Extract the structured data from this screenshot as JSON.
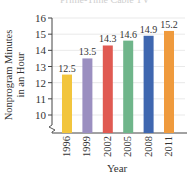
{
  "chart_data": {
    "type": "bar",
    "title": "Prime-Time Cable TV",
    "xlabel": "Year",
    "ylabel": [
      "Nonprogram Minutes",
      "in an Hour"
    ],
    "categories": [
      "1996",
      "1999",
      "2002",
      "2005",
      "2008",
      "2011"
    ],
    "values": [
      12.5,
      13.5,
      14.3,
      14.6,
      14.9,
      15.2
    ],
    "data_labels": [
      "12.5",
      "13.5",
      "14.3",
      "14.6",
      "14.9",
      "15.2"
    ],
    "colors": [
      "#f2c53d",
      "#9b8fc0",
      "#e05a52",
      "#6fb58a",
      "#3f67b0",
      "#ef9a3d"
    ],
    "yticks": [
      10,
      11,
      12,
      13,
      14,
      15,
      16
    ],
    "ylim": [
      9.2,
      16
    ],
    "axis_break": true,
    "grid": true
  }
}
